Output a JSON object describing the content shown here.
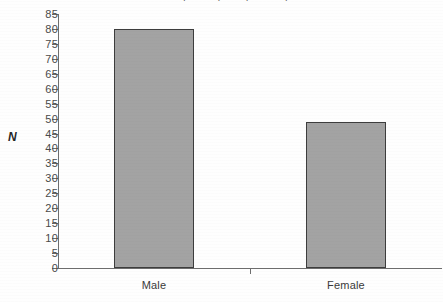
{
  "chart_data": {
    "type": "bar",
    "title": "Participants by Sex (N = 129)",
    "xlabel": "",
    "ylabel": "N",
    "categories": [
      "Male",
      "Female"
    ],
    "values": [
      80,
      49
    ],
    "ylim": [
      0,
      85
    ],
    "ytick_step": 5,
    "yticks": [
      85,
      80,
      75,
      70,
      65,
      60,
      55,
      50,
      45,
      40,
      35,
      30,
      25,
      20,
      15,
      10,
      5,
      0
    ],
    "grid": false,
    "legend": null,
    "series": [
      {
        "name": "N",
        "values": [
          80,
          49
        ]
      }
    ],
    "colors": {
      "bar_fill": "#a3a3a3",
      "bar_border": "#3d3d3d",
      "axis": "#6e6e6e",
      "text": "#3a3a3a",
      "background": "#fefefe"
    }
  }
}
